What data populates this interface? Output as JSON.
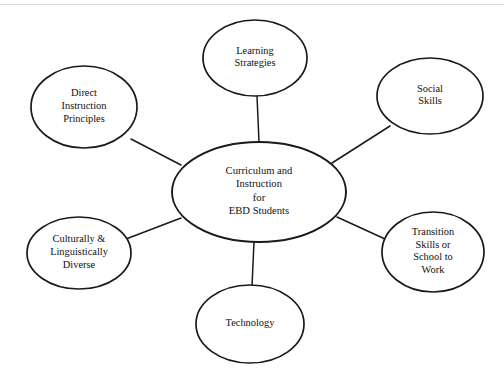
{
  "diagram": {
    "type": "hub-and-spoke concept map",
    "background_color": "#ffffff",
    "stroke_color": "#1a1a1a",
    "text_color": "#111111",
    "center": {
      "id": "center",
      "lines": [
        "Curriculum and",
        "Instruction",
        "for",
        "EBD Students"
      ],
      "cx": 259,
      "cy": 192,
      "rx": 87,
      "ry": 50
    },
    "nodes": [
      {
        "id": "learning-strategies",
        "lines": [
          "Learning",
          "Strategies"
        ],
        "cx": 255,
        "cy": 58,
        "rx": 52,
        "ry": 38
      },
      {
        "id": "social-skills",
        "lines": [
          "Social",
          "Skills"
        ],
        "cx": 430,
        "cy": 96,
        "rx": 53,
        "ry": 38
      },
      {
        "id": "transition-skills",
        "lines": [
          "Transition",
          "Skills or",
          "School to",
          "Work"
        ],
        "cx": 433,
        "cy": 252,
        "rx": 51,
        "ry": 40
      },
      {
        "id": "technology",
        "lines": [
          "Technology"
        ],
        "cx": 250,
        "cy": 324,
        "rx": 54,
        "ry": 39
      },
      {
        "id": "culturally-linguistically-diverse",
        "lines": [
          "Culturally &",
          "Linguistically",
          "Diverse"
        ],
        "cx": 79,
        "cy": 253,
        "rx": 52,
        "ry": 36
      },
      {
        "id": "direct-instruction-principles",
        "lines": [
          "Direct",
          "Instruction",
          "Principles"
        ],
        "cx": 84,
        "cy": 107,
        "rx": 53,
        "ry": 41
      }
    ],
    "connectors": [
      {
        "id": "center-to-learning-strategies",
        "from": "center",
        "to": "learning-strategies",
        "x1": 259,
        "y1": 142,
        "x2": 257,
        "y2": 96
      },
      {
        "id": "center-to-social-skills",
        "from": "center",
        "to": "social-skills",
        "x1": 332,
        "y1": 163,
        "x2": 390,
        "y2": 126
      },
      {
        "id": "center-to-transition-skills",
        "from": "center",
        "to": "transition-skills",
        "x1": 337,
        "y1": 217,
        "x2": 385,
        "y2": 239
      },
      {
        "id": "center-to-technology",
        "from": "center",
        "to": "technology",
        "x1": 254,
        "y1": 242,
        "x2": 252,
        "y2": 286
      },
      {
        "id": "center-to-culturally-diverse",
        "from": "center",
        "to": "culturally-linguistically-diverse",
        "x1": 181,
        "y1": 218,
        "x2": 126,
        "y2": 239
      },
      {
        "id": "center-to-direct-instruction",
        "from": "center",
        "to": "direct-instruction-principles",
        "x1": 181,
        "y1": 165,
        "x2": 131,
        "y2": 139
      }
    ]
  }
}
